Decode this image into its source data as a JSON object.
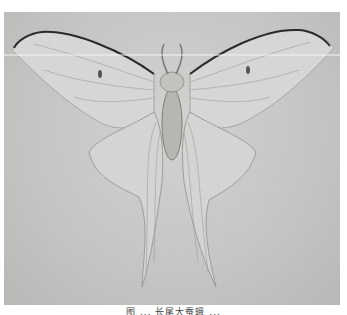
{
  "image": {
    "subject": "Luna moth (Actias) specimen, wings spread, grayscale photograph",
    "background_color": "#c6c6c4",
    "wing_color": "#d8d8d6",
    "vein_color": "#8a8a88",
    "costa_color": "#2a2a2a",
    "scan_line_color": "#f4f4f4"
  },
  "caption": {
    "text": "图 ... 长尾大蚕蛾 ..."
  }
}
